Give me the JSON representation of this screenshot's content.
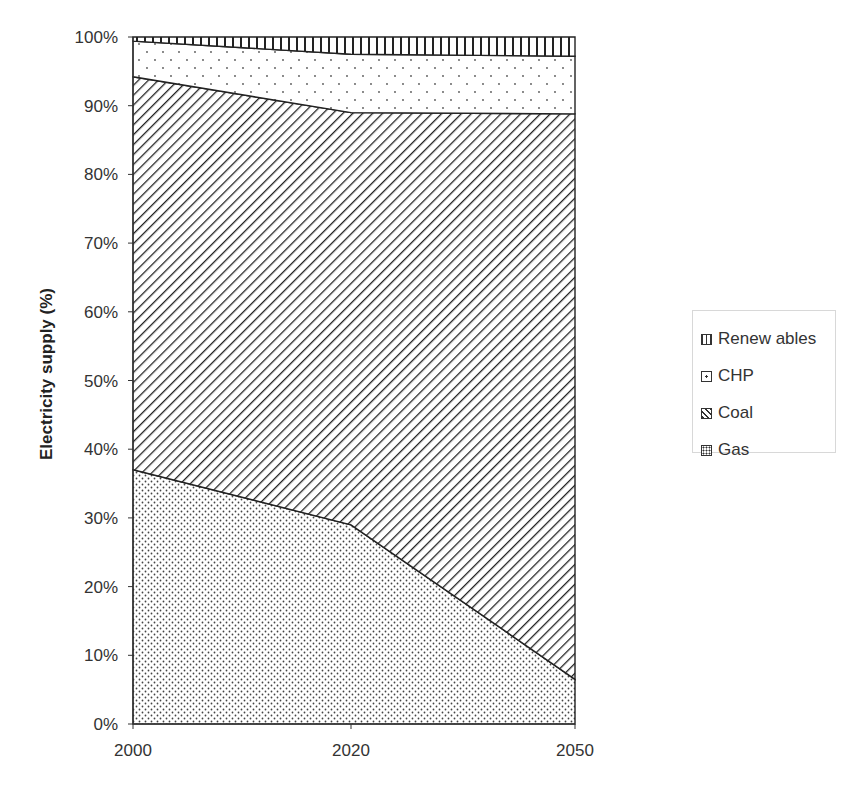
{
  "chart_data": {
    "type": "area",
    "stacked": true,
    "normalized": true,
    "title": "",
    "xlabel": "",
    "ylabel": "Electricity supply (%)",
    "x": [
      "2000",
      "2020",
      "2050"
    ],
    "yticks": [
      "0%",
      "10%",
      "20%",
      "30%",
      "40%",
      "50%",
      "60%",
      "70%",
      "80%",
      "90%",
      "100%"
    ],
    "ylim": [
      0,
      100
    ],
    "grid": false,
    "legend_position": "right",
    "series": [
      {
        "name": "Gas",
        "pattern": "dots-dense",
        "values": [
          37.0,
          29.0,
          6.5
        ]
      },
      {
        "name": "Coal",
        "pattern": "diagonal-hatch",
        "values": [
          57.2,
          60.0,
          82.3
        ]
      },
      {
        "name": "CHP",
        "pattern": "dots-sparse",
        "values": [
          5.2,
          8.5,
          8.4
        ]
      },
      {
        "name": "Renewables",
        "pattern": "vertical-lines",
        "values": [
          0.6,
          2.5,
          2.8
        ]
      }
    ]
  },
  "legend": {
    "items": [
      {
        "label": "Renew ables",
        "pattern": "vertical-lines"
      },
      {
        "label": "CHP",
        "pattern": "dots-sparse"
      },
      {
        "label": "Coal",
        "pattern": "diagonal-hatch"
      },
      {
        "label": "Gas",
        "pattern": "dots-dense"
      }
    ]
  },
  "axis": {
    "y_title": "Electricity supply (%)",
    "x_labels": [
      "2000",
      "2020",
      "2050"
    ]
  }
}
